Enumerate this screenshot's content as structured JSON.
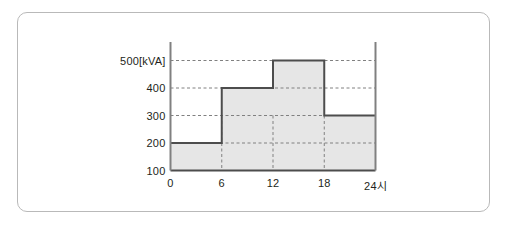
{
  "figure": {
    "card_label": "load-duration-step-chart-card"
  },
  "chart_data": {
    "type": "bar",
    "title": "",
    "subtitle": "",
    "xlabel": "",
    "ylabel": "",
    "unit_label": "[kVA]",
    "categories": [
      "0-6",
      "6-12",
      "12-18",
      "18-24"
    ],
    "x_edges": [
      0,
      6,
      12,
      18,
      24
    ],
    "values": [
      200,
      400,
      500,
      300
    ],
    "x_tick_labels": [
      "0",
      "6",
      "12",
      "18",
      "24시"
    ],
    "x_ticks": [
      0,
      6,
      12,
      18,
      24
    ],
    "y_tick_labels": [
      "500[kVA]",
      "400",
      "300",
      "200",
      "100"
    ],
    "y_ticks": [
      500,
      400,
      300,
      200,
      100
    ],
    "xlim": [
      0,
      24
    ],
    "ylim": [
      100,
      560
    ],
    "grid": "dashed-horizontal-and-vertical",
    "legend": "none",
    "series": [
      {
        "name": "load",
        "values": [
          200,
          400,
          500,
          300
        ]
      }
    ],
    "colors": {
      "fill": "#e6e6e6",
      "step_line": "#4d4d4d",
      "axis": "#808080",
      "gridline": "#808080",
      "text": "#231f20",
      "card_border": "#b9b9b9"
    }
  }
}
